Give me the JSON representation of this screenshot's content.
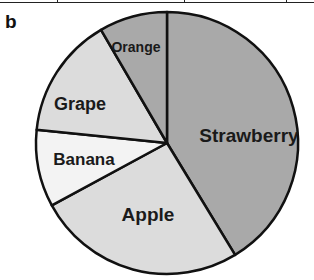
{
  "panel_label": "b",
  "chart_data": {
    "type": "pie",
    "title": "",
    "start_angle_deg": 0,
    "direction": "clockwise",
    "slices": [
      {
        "label": "Strawberry",
        "value": 41.3,
        "color": "#a9a9a9"
      },
      {
        "label": "Apple",
        "value": 25.8,
        "color": "#dcdcdc"
      },
      {
        "label": "Banana",
        "value": 9.5,
        "color": "#f3f3f3"
      },
      {
        "label": "Grape",
        "value": 15.0,
        "color": "#dcdcdc"
      },
      {
        "label": "Orange",
        "value": 8.4,
        "color": "#a9a9a9"
      }
    ],
    "labels_inside": true,
    "legend": "none",
    "units": "percent (estimated)"
  },
  "layout": {
    "center": [
      167,
      143
    ],
    "radius": 131,
    "label_positions": [
      {
        "x": 249,
        "y": 137,
        "size": 19
      },
      {
        "x": 148,
        "y": 216,
        "size": 19
      },
      {
        "x": 84,
        "y": 161,
        "size": 17
      },
      {
        "x": 80,
        "y": 105,
        "size": 18
      },
      {
        "x": 136,
        "y": 48,
        "size": 14
      }
    ]
  }
}
